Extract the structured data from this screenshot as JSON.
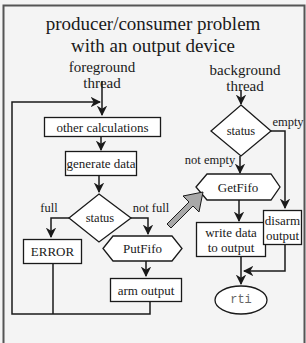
{
  "title": {
    "line1": "producer/consumer problem",
    "line2": "with an output device"
  },
  "foreground": {
    "heading_line1": "foreground",
    "heading_line2": "thread",
    "nodes": {
      "other_calculations": "other calculations",
      "generate_data": "generate data",
      "status": "status",
      "error": "ERROR",
      "putfifo": "PutFifo",
      "arm_output": "arm output"
    },
    "edge_labels": {
      "full": "full",
      "not_full": "not full"
    }
  },
  "background": {
    "heading_line1": "background",
    "heading_line2": "thread",
    "nodes": {
      "status": "status",
      "getfifo": "GetFifo",
      "write_line1": "write data",
      "write_line2": "to output",
      "disarm_line1": "disarm",
      "disarm_line2": "output",
      "rti": "rti"
    },
    "edge_labels": {
      "empty": "empty",
      "not_empty": "not empty"
    }
  },
  "colors": {
    "background": "#f4f4f4",
    "stroke": "#1a1a1a",
    "box_fill": "#ffffff",
    "fifo_arrow": "#a8a8a8",
    "rti_text": "#666666"
  }
}
